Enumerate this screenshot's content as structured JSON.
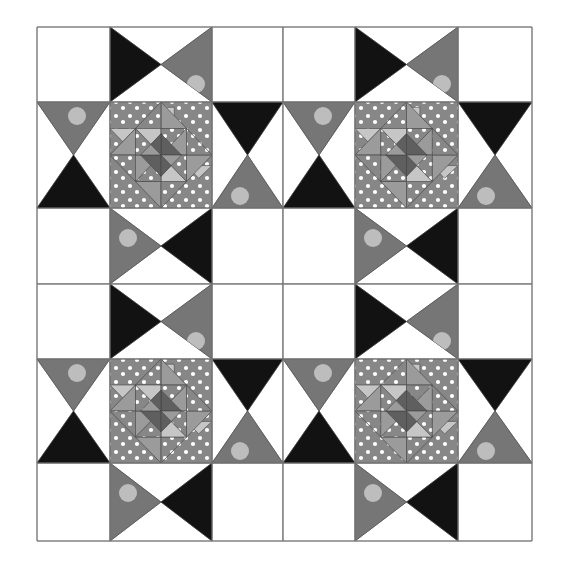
{
  "diagram": {
    "type": "quilt-layout",
    "blocks_across": 2,
    "blocks_down": 2,
    "outer_border": {
      "x": 37,
      "y": 27,
      "right": 532,
      "bottom": 541
    },
    "column_edges": [
      37,
      110,
      212,
      283,
      355,
      458,
      532
    ],
    "row_edges": [
      27,
      102,
      208,
      284,
      359,
      463,
      541
    ],
    "blocks": [
      {
        "id": "block-top-left",
        "cols": [
          0,
          1,
          2,
          3
        ],
        "rows": [
          0,
          1,
          2,
          3
        ]
      },
      {
        "id": "block-top-right",
        "cols": [
          3,
          4,
          5,
          6
        ],
        "rows": [
          0,
          1,
          2,
          3
        ]
      },
      {
        "id": "block-bottom-left",
        "cols": [
          0,
          1,
          2,
          3
        ],
        "rows": [
          3,
          4,
          5,
          6
        ]
      },
      {
        "id": "block-bottom-right",
        "cols": [
          3,
          4,
          5,
          6
        ],
        "rows": [
          3,
          4,
          5,
          6
        ]
      }
    ],
    "star_points": {
      "top": {
        "left": "black",
        "right": "sun_print",
        "outer": "white",
        "inner": "white"
      },
      "right": {
        "top": "black",
        "bottom": "sun_print",
        "outer": "white",
        "inner": "white"
      },
      "bottom": {
        "left": "sun_print",
        "right": "black",
        "outer": "white",
        "inner": "white"
      },
      "left": {
        "top": "sun_print",
        "bottom": "black",
        "outer": "white",
        "inner": "white"
      }
    },
    "corner_squares": "white",
    "center_medallion": "square-in-square with polka-dot triangles and central pinwheel"
  },
  "colors": {
    "background": "#ffffff",
    "grid_line": "#7a7a7a",
    "white": "#ffffff",
    "black": "#121212",
    "sun_print": "#767676",
    "sun_circle": "#bdbdbd",
    "polka": "#878787",
    "polka_dot": "#ffffff",
    "light": "#c6c6c6",
    "medium": "#9b9b9b",
    "dark": "#5f5f5f"
  }
}
